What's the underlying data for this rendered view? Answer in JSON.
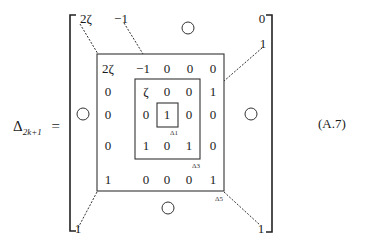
{
  "equation": {
    "lhs_symbol": "Δ",
    "lhs_subscript": "2k+1",
    "equals": "=",
    "number": "(A.7)"
  },
  "outer_matrix": {
    "top_left": "2ζ",
    "top_second": "−1",
    "top_right": "0",
    "right_second": "1",
    "bottom_left": "1",
    "bottom_right": "1",
    "zero_block_symbol": "○"
  },
  "delta5": {
    "label": "Δ5",
    "rows": [
      [
        "2ζ",
        "−1",
        "0",
        "0",
        "0"
      ],
      [
        "0",
        "ζ",
        "0",
        "0",
        "1"
      ],
      [
        "0",
        "0",
        "1",
        "0",
        "0"
      ],
      [
        "0",
        "1",
        "0",
        "1",
        "0"
      ],
      [
        "1",
        "0",
        "0",
        "0",
        "1"
      ]
    ]
  },
  "delta3": {
    "label": "Δ3"
  },
  "delta1": {
    "label": "Δ1"
  }
}
